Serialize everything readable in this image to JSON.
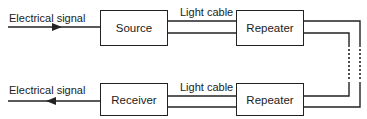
{
  "diagram": {
    "title": "",
    "nodes": {
      "source": "Source",
      "repeater_top": "Repeater",
      "repeater_bottom": "Repeater",
      "receiver": "Receiver"
    },
    "labels": {
      "input_signal": "Electrical signal",
      "output_signal": "Electrical signal",
      "cable_top": "Light cable",
      "cable_bottom": "Light cable"
    },
    "edges": [
      {
        "from": "input",
        "to": "source",
        "label": "Electrical signal",
        "type": "arrow"
      },
      {
        "from": "source",
        "to": "repeater_top",
        "label": "Light cable",
        "type": "double-line"
      },
      {
        "from": "repeater_top",
        "to": "repeater_bottom",
        "label": "",
        "type": "double-line-dotted"
      },
      {
        "from": "repeater_bottom",
        "to": "receiver",
        "label": "Light cable",
        "type": "double-line"
      },
      {
        "from": "receiver",
        "to": "output",
        "label": "Electrical signal",
        "type": "arrow"
      }
    ],
    "colors": {
      "line": "#222222",
      "background": "#ffffff"
    }
  }
}
